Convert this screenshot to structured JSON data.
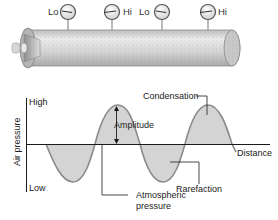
{
  "figure": {
    "tube": {
      "gauges": [
        {
          "label": "Lo",
          "side": "left",
          "x": 68
        },
        {
          "label": "Hi",
          "side": "right",
          "x": 112
        },
        {
          "label": "Lo",
          "side": "left",
          "x": 162
        },
        {
          "label": "Hi",
          "side": "right",
          "x": 208
        }
      ]
    },
    "graph": {
      "y_axis_label": "Air pressure",
      "y_high_label": "High",
      "y_low_label": "Low",
      "x_axis_label": "Distance",
      "annotations": {
        "condensation": "Condensation",
        "amplitude": "Amplitude",
        "rarefaction": "Rarefaction",
        "atmospheric_line1": "Atmospheric",
        "atmospheric_line2": "pressure"
      }
    },
    "colors": {
      "wave_fill": "#d4d4d4",
      "wave_stroke": "#8a8a8a",
      "axis": "#1a1a1a",
      "tube_body": "#d8d8d8"
    }
  }
}
